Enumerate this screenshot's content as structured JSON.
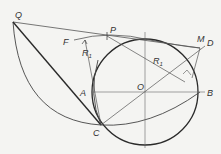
{
  "diagram": {
    "type": "geometric-construction",
    "colors": {
      "background": "#f4f4f2",
      "stroke": "#2a2a2a",
      "thin": "#555555",
      "label": "#333333"
    },
    "points": {
      "Q": {
        "label": "Q",
        "x": 13,
        "y": 22
      },
      "P": {
        "label": "P",
        "x": 107,
        "y": 36
      },
      "F": {
        "label": "F",
        "x": 74,
        "y": 40
      },
      "M": {
        "label": "M",
        "x": 199,
        "y": 48
      },
      "D": {
        "label": "D",
        "x": 208,
        "y": 42
      },
      "A": {
        "label": "A",
        "x": 92,
        "y": 92
      },
      "O": {
        "label": "O",
        "x": 145,
        "y": 92
      },
      "B": {
        "label": "B",
        "x": 205,
        "y": 92
      },
      "C": {
        "label": "C",
        "x": 101,
        "y": 125
      }
    },
    "labels": {
      "Q": "Q",
      "P": "P",
      "F": "F",
      "R1_left": "R",
      "R1_left_sub": "1",
      "R1_right": "R",
      "R1_right_sub": "1",
      "M": "M",
      "D": "D",
      "A": "A",
      "O": "O",
      "B": "B",
      "C": "C"
    },
    "circle": {
      "center": "O",
      "radius": 53
    }
  }
}
